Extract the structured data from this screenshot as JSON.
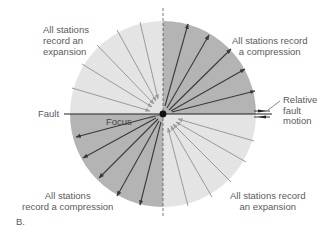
{
  "figure": {
    "panel_label": "B.",
    "labels": {
      "nw_quadrant": [
        "All stations",
        "record an",
        "expansion"
      ],
      "ne_quadrant": [
        "All stations record",
        "a compression"
      ],
      "sw_quadrant": [
        "All stations",
        "record a compression"
      ],
      "se_quadrant": [
        "All stations record",
        "an expansion"
      ],
      "fault": "Fault",
      "focus": "Focus",
      "relative_fault_motion": [
        "Relative",
        "fault",
        "motion"
      ]
    },
    "colors": {
      "compression_fill": "#b4b4b4",
      "expansion_fill": "#e4e4e4",
      "compression_arrow": "#3a3a3a",
      "expansion_arrow": "#9a9a9a",
      "fault_line": "#222222",
      "text": "#5a5a5a"
    }
  }
}
